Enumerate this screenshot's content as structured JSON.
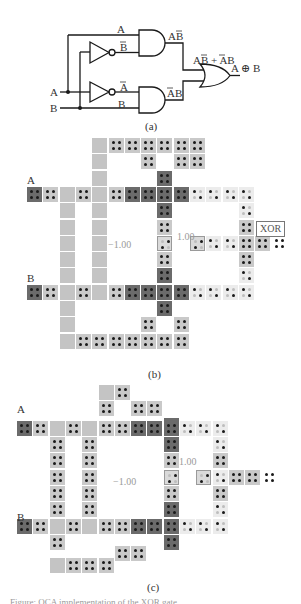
{
  "panel_a": {
    "label": "(a)",
    "inputs": {
      "a": "A",
      "b": "B"
    },
    "wire_labels": {
      "top_a": "A",
      "not_b": "B̄",
      "not_a": "Ā",
      "bottom_b": "B"
    },
    "and_outputs": {
      "top": "AB̄",
      "bottom": "ĀB"
    },
    "or_input_expr": "AB̄ + ĀB",
    "output": "A ⊕ B"
  },
  "panel_b": {
    "label": "(b)",
    "input_a": "A",
    "input_b": "B",
    "fixed_neg": "−1.00",
    "fixed_pos": "1.00",
    "output_box": "XOR",
    "origin": {
      "x": 27,
      "y": 138
    },
    "pitch": 16.3,
    "cells": [
      {
        "c": 4,
        "r": 0,
        "t": "plain"
      },
      {
        "c": 5,
        "r": 0,
        "t": "dot"
      },
      {
        "c": 6,
        "r": 0,
        "t": "dot"
      },
      {
        "c": 7,
        "r": 0,
        "t": "dot"
      },
      {
        "c": 8,
        "r": 0,
        "t": "dot"
      },
      {
        "c": 9,
        "r": 0,
        "t": "dot"
      },
      {
        "c": 10,
        "r": 0,
        "t": "dot"
      },
      {
        "c": 4,
        "r": 1,
        "t": "plain"
      },
      {
        "c": 7,
        "r": 1,
        "t": "dot"
      },
      {
        "c": 9,
        "r": 1,
        "t": "dot"
      },
      {
        "c": 10,
        "r": 1,
        "t": "dot"
      },
      {
        "c": 4,
        "r": 2,
        "t": "plain"
      },
      {
        "c": 8,
        "r": 2,
        "t": "dark"
      },
      {
        "c": 0,
        "r": 3,
        "t": "dark"
      },
      {
        "c": 1,
        "r": 3,
        "t": "dot"
      },
      {
        "c": 2,
        "r": 3,
        "t": "plain"
      },
      {
        "c": 3,
        "r": 3,
        "t": "dot"
      },
      {
        "c": 4,
        "r": 3,
        "t": "plain"
      },
      {
        "c": 5,
        "r": 3,
        "t": "dot"
      },
      {
        "c": 6,
        "r": 3,
        "t": "dark"
      },
      {
        "c": 7,
        "r": 3,
        "t": "dark"
      },
      {
        "c": 8,
        "r": 3,
        "t": "dark"
      },
      {
        "c": 9,
        "r": 3,
        "t": "dark"
      },
      {
        "c": 10,
        "r": 3,
        "t": "light"
      },
      {
        "c": 11,
        "r": 3,
        "t": "light"
      },
      {
        "c": 12,
        "r": 3,
        "t": "light"
      },
      {
        "c": 13,
        "r": 3,
        "t": "light"
      },
      {
        "c": 2,
        "r": 4,
        "t": "plain"
      },
      {
        "c": 4,
        "r": 4,
        "t": "plain"
      },
      {
        "c": 8,
        "r": 4,
        "t": "dark"
      },
      {
        "c": 13,
        "r": 4,
        "t": "light"
      },
      {
        "c": 2,
        "r": 5,
        "t": "plain"
      },
      {
        "c": 4,
        "r": 5,
        "t": "plain"
      },
      {
        "c": 8,
        "r": 5,
        "t": "dot"
      },
      {
        "c": 13,
        "r": 5,
        "t": "dot"
      },
      {
        "c": 2,
        "r": 6,
        "t": "plain"
      },
      {
        "c": 4,
        "r": 6,
        "t": "plain"
      },
      {
        "c": 8,
        "r": 6,
        "t": "fix"
      },
      {
        "c": 10,
        "r": 6,
        "t": "fix"
      },
      {
        "c": 11,
        "r": 6,
        "t": "light"
      },
      {
        "c": 12,
        "r": 6,
        "t": "light"
      },
      {
        "c": 13,
        "r": 6,
        "t": "dot"
      },
      {
        "c": 14,
        "r": 6,
        "t": "dot"
      },
      {
        "c": 15,
        "r": 6,
        "t": "out"
      },
      {
        "c": 2,
        "r": 7,
        "t": "plain"
      },
      {
        "c": 4,
        "r": 7,
        "t": "plain"
      },
      {
        "c": 8,
        "r": 7,
        "t": "dot"
      },
      {
        "c": 13,
        "r": 7,
        "t": "dot"
      },
      {
        "c": 2,
        "r": 8,
        "t": "plain"
      },
      {
        "c": 4,
        "r": 8,
        "t": "plain"
      },
      {
        "c": 8,
        "r": 8,
        "t": "dark"
      },
      {
        "c": 13,
        "r": 8,
        "t": "light"
      },
      {
        "c": 0,
        "r": 9,
        "t": "dark"
      },
      {
        "c": 1,
        "r": 9,
        "t": "dot"
      },
      {
        "c": 2,
        "r": 9,
        "t": "plain"
      },
      {
        "c": 3,
        "r": 9,
        "t": "dot"
      },
      {
        "c": 4,
        "r": 9,
        "t": "plain"
      },
      {
        "c": 5,
        "r": 9,
        "t": "dot"
      },
      {
        "c": 6,
        "r": 9,
        "t": "dark"
      },
      {
        "c": 7,
        "r": 9,
        "t": "dark"
      },
      {
        "c": 8,
        "r": 9,
        "t": "dark"
      },
      {
        "c": 9,
        "r": 9,
        "t": "dark"
      },
      {
        "c": 10,
        "r": 9,
        "t": "light"
      },
      {
        "c": 11,
        "r": 9,
        "t": "light"
      },
      {
        "c": 12,
        "r": 9,
        "t": "light"
      },
      {
        "c": 13,
        "r": 9,
        "t": "light"
      },
      {
        "c": 2,
        "r": 10,
        "t": "plain"
      },
      {
        "c": 8,
        "r": 10,
        "t": "dark"
      },
      {
        "c": 2,
        "r": 11,
        "t": "plain"
      },
      {
        "c": 7,
        "r": 11,
        "t": "dot"
      },
      {
        "c": 9,
        "r": 11,
        "t": "dot"
      },
      {
        "c": 2,
        "r": 12,
        "t": "plain"
      },
      {
        "c": 3,
        "r": 12,
        "t": "dot"
      },
      {
        "c": 4,
        "r": 12,
        "t": "dot"
      },
      {
        "c": 5,
        "r": 12,
        "t": "dot"
      },
      {
        "c": 6,
        "r": 12,
        "t": "dot"
      },
      {
        "c": 7,
        "r": 12,
        "t": "dot"
      },
      {
        "c": 8,
        "r": 12,
        "t": "dot"
      },
      {
        "c": 9,
        "r": 12,
        "t": "dot"
      }
    ]
  },
  "panel_c": {
    "label": "(c)",
    "input_a": "A",
    "input_b": "B",
    "fixed_neg": "−1.00",
    "fixed_pos": "1.00",
    "origin": {
      "x": 17,
      "y": 385
    },
    "pitch": 16.3,
    "cells": [
      {
        "c": 5,
        "r": 0,
        "t": "plain"
      },
      {
        "c": 6,
        "r": 0,
        "t": "dot"
      },
      {
        "c": 5,
        "r": 1,
        "t": "dot"
      },
      {
        "c": 7,
        "r": 1,
        "t": "dot"
      },
      {
        "c": 8,
        "r": 1,
        "t": "dot"
      },
      {
        "c": 9,
        "r": 2,
        "t": "dark"
      },
      {
        "c": 0,
        "r": 2.2,
        "t": "dark"
      },
      {
        "c": 1,
        "r": 2.2,
        "t": "dot"
      },
      {
        "c": 2,
        "r": 2.2,
        "t": "plain"
      },
      {
        "c": 3,
        "r": 2.2,
        "t": "dot"
      },
      {
        "c": 4,
        "r": 2.2,
        "t": "plain"
      },
      {
        "c": 5,
        "r": 2.2,
        "t": "dot"
      },
      {
        "c": 6,
        "r": 2.2,
        "t": "dot"
      },
      {
        "c": 7,
        "r": 2.2,
        "t": "dark"
      },
      {
        "c": 8,
        "r": 2.2,
        "t": "dark"
      },
      {
        "c": 9,
        "r": 2.2,
        "t": "dark"
      },
      {
        "c": 10,
        "r": 2.2,
        "t": "light"
      },
      {
        "c": 11,
        "r": 2.2,
        "t": "light"
      },
      {
        "c": 12,
        "r": 2.2,
        "t": "light"
      },
      {
        "c": 2,
        "r": 3.2,
        "t": "dot"
      },
      {
        "c": 4,
        "r": 3.2,
        "t": "dot"
      },
      {
        "c": 9,
        "r": 3.2,
        "t": "dark"
      },
      {
        "c": 12,
        "r": 3.2,
        "t": "light"
      },
      {
        "c": 2,
        "r": 4.2,
        "t": "dot"
      },
      {
        "c": 4,
        "r": 4.2,
        "t": "dot"
      },
      {
        "c": 9,
        "r": 4.2,
        "t": "dot"
      },
      {
        "c": 12,
        "r": 4.2,
        "t": "dot"
      },
      {
        "c": 2,
        "r": 5.2,
        "t": "dot"
      },
      {
        "c": 4,
        "r": 5.2,
        "t": "dot"
      },
      {
        "c": 9,
        "r": 5.2,
        "t": "fix"
      },
      {
        "c": 11,
        "r": 5.2,
        "t": "fix"
      },
      {
        "c": 12,
        "r": 5.2,
        "t": "light"
      },
      {
        "c": 13,
        "r": 5.2,
        "t": "dot"
      },
      {
        "c": 14,
        "r": 5.2,
        "t": "dot"
      },
      {
        "c": 15,
        "r": 5.2,
        "t": "out"
      },
      {
        "c": 2,
        "r": 6.2,
        "t": "dot"
      },
      {
        "c": 4,
        "r": 6.2,
        "t": "dot"
      },
      {
        "c": 9,
        "r": 6.2,
        "t": "dot"
      },
      {
        "c": 12,
        "r": 6.2,
        "t": "dot"
      },
      {
        "c": 2,
        "r": 7.2,
        "t": "dot"
      },
      {
        "c": 4,
        "r": 7.2,
        "t": "dot"
      },
      {
        "c": 9,
        "r": 7.2,
        "t": "dark"
      },
      {
        "c": 12,
        "r": 7.2,
        "t": "light"
      },
      {
        "c": 0,
        "r": 8.2,
        "t": "dark"
      },
      {
        "c": 1,
        "r": 8.2,
        "t": "dot"
      },
      {
        "c": 2,
        "r": 8.2,
        "t": "plain"
      },
      {
        "c": 3,
        "r": 8.2,
        "t": "dot"
      },
      {
        "c": 4,
        "r": 8.2,
        "t": "plain"
      },
      {
        "c": 5,
        "r": 8.2,
        "t": "dot"
      },
      {
        "c": 6,
        "r": 8.2,
        "t": "dot"
      },
      {
        "c": 7,
        "r": 8.2,
        "t": "dark"
      },
      {
        "c": 8,
        "r": 8.2,
        "t": "dark"
      },
      {
        "c": 9,
        "r": 8.2,
        "t": "dark"
      },
      {
        "c": 10,
        "r": 8.2,
        "t": "light"
      },
      {
        "c": 11,
        "r": 8.2,
        "t": "light"
      },
      {
        "c": 12,
        "r": 8.2,
        "t": "light"
      },
      {
        "c": 2,
        "r": 9.2,
        "t": "dot"
      },
      {
        "c": 9,
        "r": 9.2,
        "t": "dark"
      },
      {
        "c": 6,
        "r": 9.9,
        "t": "dot"
      },
      {
        "c": 7,
        "r": 9.9,
        "t": "dot"
      },
      {
        "c": 2,
        "r": 10.6,
        "t": "plain"
      },
      {
        "c": 3,
        "r": 10.6,
        "t": "dot"
      },
      {
        "c": 4,
        "r": 10.6,
        "t": "dot"
      },
      {
        "c": 5,
        "r": 10.6,
        "t": "dot"
      }
    ]
  },
  "caption": "Figure: QCA implementation of the XOR gate"
}
